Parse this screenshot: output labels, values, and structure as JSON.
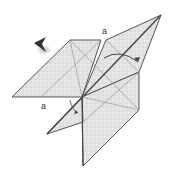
{
  "diagram": {
    "type": "origami-fold-step",
    "labels": [
      {
        "id": "a-top",
        "text": "a",
        "x": 102,
        "y": 26
      },
      {
        "id": "a-bottom",
        "text": "a",
        "x": 41,
        "y": 101
      }
    ],
    "colors": {
      "paper": "#e4e4e4",
      "paper_dark": "#cfcfcf",
      "line": "#555555",
      "crease": "#8a8a8a",
      "arrow": "#444444"
    }
  }
}
